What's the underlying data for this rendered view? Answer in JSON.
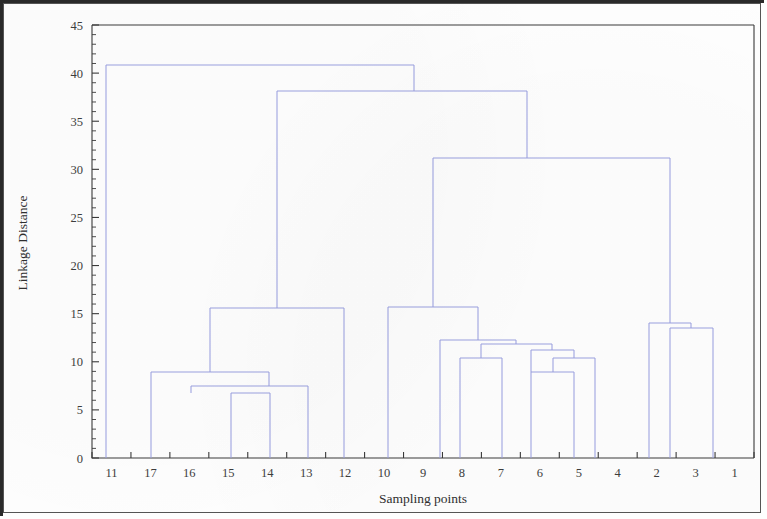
{
  "figure": {
    "border_color": "#2a2a2a",
    "background": "#fefefe"
  },
  "chart_data": {
    "type": "line",
    "chart_subtype": "dendrogram",
    "title": "",
    "xlabel": "Sampling points",
    "ylabel": "Linkage Distance",
    "grid": false,
    "legend": null,
    "link_color": "#9aa0e0",
    "ylim": [
      0,
      45
    ],
    "y_ticks": [
      0,
      5,
      10,
      15,
      20,
      25,
      30,
      35,
      40,
      45
    ],
    "y_tick_labels": [
      "0",
      "5",
      "10",
      "15",
      "20",
      "25",
      "30",
      "35",
      "40",
      "45"
    ],
    "y_minor_tick_step": 1,
    "leaf_order": [
      "11",
      "17",
      "16",
      "15",
      "14",
      "13",
      "12",
      "10",
      "9",
      "8",
      "7",
      "6",
      "5",
      "4",
      "2",
      "3",
      "1"
    ],
    "leaf_count": 17,
    "merges": [
      {
        "id": "m1",
        "label": "15 + 14",
        "children": [
          "15",
          "14"
        ],
        "height": 6.8
      },
      {
        "id": "m2",
        "label": "16 + (15,14)",
        "children": [
          "16",
          "m1"
        ],
        "height": 7.3
      },
      {
        "id": "m3",
        "label": "((16,15,14)) + 13",
        "children": [
          "m2",
          "13"
        ],
        "height": 7.6
      },
      {
        "id": "m4",
        "label": "17 + (16,15,14,13)",
        "children": [
          "17",
          "m3"
        ],
        "height": 9.2
      },
      {
        "id": "m5",
        "label": "6 + 5",
        "children": [
          "6",
          "5"
        ],
        "height": 9.2
      },
      {
        "id": "m6",
        "label": "8 + 7",
        "children": [
          "8",
          "7"
        ],
        "height": 10.3
      },
      {
        "id": "m7",
        "label": "(6,5) + 4",
        "children": [
          "m5",
          "4"
        ],
        "height": 10.4
      },
      {
        "id": "m8",
        "label": "((6,5),4) + right-mid",
        "children": [
          "m7",
          "m9"
        ],
        "height": 12.0
      },
      {
        "id": "m9",
        "label": "(8,7) merge node",
        "children": [
          "m6"
        ],
        "height": 12.2
      },
      {
        "id": "m10",
        "label": "(8,7,6,5,4) group",
        "children": [
          "m6",
          "m8"
        ],
        "height": 12.4
      },
      {
        "id": "m11",
        "label": "3 + 1",
        "children": [
          "3",
          "1"
        ],
        "height": 13.5
      },
      {
        "id": "m12",
        "label": "2 + (3,1)",
        "children": [
          "2",
          "m11"
        ],
        "height": 14.1
      },
      {
        "id": "m13",
        "label": "(17,16,15,14,13) + 12",
        "children": [
          "m4",
          "12"
        ],
        "height": 15.6
      },
      {
        "id": "m14",
        "label": "(10,9) + (8,7,6,5,4)",
        "children": [
          "m15",
          "m10"
        ],
        "height": 15.7
      },
      {
        "id": "m15",
        "label": "10 + 9",
        "children": [
          "10",
          "9"
        ],
        "height": 15.7
      },
      {
        "id": "m16",
        "label": "right-mid + (2,3,1)",
        "children": [
          "m14",
          "m12"
        ],
        "height": 31.2
      },
      {
        "id": "m17",
        "label": "left-block + right-block",
        "children": [
          "m13",
          "m16"
        ],
        "height": 37.9
      },
      {
        "id": "m18",
        "label": "root: 11 + rest",
        "children": [
          "11",
          "m17"
        ],
        "height": 40.7
      }
    ],
    "links": [
      {
        "x1": 103.0,
        "y1": 455.0,
        "x2": 103.0,
        "y2": 62.0
      },
      {
        "x1": 103.0,
        "y1": 62.0,
        "x2": 411.0,
        "y2": 62.0
      },
      {
        "x1": 411.0,
        "y1": 62.0,
        "x2": 411.0,
        "y2": 88.0
      },
      {
        "x1": 274.0,
        "y1": 88.0,
        "x2": 524.0,
        "y2": 88.0
      },
      {
        "x1": 274.0,
        "y1": 88.0,
        "x2": 274.0,
        "y2": 305.0
      },
      {
        "x1": 524.0,
        "y1": 88.0,
        "x2": 524.0,
        "y2": 155.0
      },
      {
        "x1": 430.0,
        "y1": 155.0,
        "x2": 667.0,
        "y2": 155.0
      },
      {
        "x1": 430.0,
        "y1": 155.0,
        "x2": 430.0,
        "y2": 304.0
      },
      {
        "x1": 667.0,
        "y1": 155.0,
        "x2": 667.0,
        "y2": 320.0
      },
      {
        "x1": 207.0,
        "y1": 305.0,
        "x2": 341.0,
        "y2": 305.0
      },
      {
        "x1": 207.0,
        "y1": 305.0,
        "x2": 207.0,
        "y2": 369.0
      },
      {
        "x1": 341.0,
        "y1": 305.0,
        "x2": 341.0,
        "y2": 455.0
      },
      {
        "x1": 148.0,
        "y1": 369.0,
        "x2": 266.0,
        "y2": 369.0
      },
      {
        "x1": 148.0,
        "y1": 369.0,
        "x2": 148.0,
        "y2": 455.0
      },
      {
        "x1": 266.0,
        "y1": 369.0,
        "x2": 266.0,
        "y2": 383.0
      },
      {
        "x1": 188.0,
        "y1": 383.0,
        "x2": 305.0,
        "y2": 383.0
      },
      {
        "x1": 188.0,
        "y1": 383.0,
        "x2": 188.0,
        "y2": 390.0
      },
      {
        "x1": 305.0,
        "y1": 383.0,
        "x2": 305.0,
        "y2": 455.0
      },
      {
        "x1": 228.0,
        "y1": 390.0,
        "x2": 267.0,
        "y2": 390.0
      },
      {
        "x1": 228.0,
        "y1": 390.0,
        "x2": 228.0,
        "y2": 455.0
      },
      {
        "x1": 267.0,
        "y1": 390.0,
        "x2": 267.0,
        "y2": 455.0
      },
      {
        "x1": 385.0,
        "y1": 304.0,
        "x2": 475.0,
        "y2": 304.0
      },
      {
        "x1": 385.0,
        "y1": 304.0,
        "x2": 385.0,
        "y2": 455.0
      },
      {
        "x1": 475.0,
        "y1": 304.0,
        "x2": 475.0,
        "y2": 337.0
      },
      {
        "x1": 437.0,
        "y1": 337.0,
        "x2": 513.0,
        "y2": 337.0
      },
      {
        "x1": 437.0,
        "y1": 337.0,
        "x2": 437.0,
        "y2": 455.0
      },
      {
        "x1": 513.0,
        "y1": 337.0,
        "x2": 513.0,
        "y2": 341.0
      },
      {
        "x1": 478.0,
        "y1": 341.0,
        "x2": 549.0,
        "y2": 341.0
      },
      {
        "x1": 478.0,
        "y1": 341.0,
        "x2": 478.0,
        "y2": 355.0
      },
      {
        "x1": 549.0,
        "y1": 341.0,
        "x2": 549.0,
        "y2": 347.0
      },
      {
        "x1": 457.0,
        "y1": 355.0,
        "x2": 499.0,
        "y2": 355.0
      },
      {
        "x1": 457.0,
        "y1": 355.0,
        "x2": 457.0,
        "y2": 455.0
      },
      {
        "x1": 499.0,
        "y1": 355.0,
        "x2": 499.0,
        "y2": 455.0
      },
      {
        "x1": 528.0,
        "y1": 347.0,
        "x2": 571.0,
        "y2": 347.0
      },
      {
        "x1": 528.0,
        "y1": 347.0,
        "x2": 528.0,
        "y2": 369.0
      },
      {
        "x1": 571.0,
        "y1": 347.0,
        "x2": 571.0,
        "y2": 355.0
      },
      {
        "x1": 550.0,
        "y1": 355.0,
        "x2": 592.0,
        "y2": 355.0
      },
      {
        "x1": 550.0,
        "y1": 355.0,
        "x2": 550.0,
        "y2": 369.0
      },
      {
        "x1": 592.0,
        "y1": 355.0,
        "x2": 592.0,
        "y2": 455.0
      },
      {
        "x1": 528.0,
        "y1": 369.0,
        "x2": 571.0,
        "y2": 369.0
      },
      {
        "x1": 528.0,
        "y1": 369.0,
        "x2": 528.0,
        "y2": 455.0
      },
      {
        "x1": 571.0,
        "y1": 369.0,
        "x2": 571.0,
        "y2": 455.0
      },
      {
        "x1": 646.0,
        "y1": 320.0,
        "x2": 688.0,
        "y2": 320.0
      },
      {
        "x1": 646.0,
        "y1": 320.0,
        "x2": 646.0,
        "y2": 455.0
      },
      {
        "x1": 688.0,
        "y1": 320.0,
        "x2": 688.0,
        "y2": 325.0
      },
      {
        "x1": 667.0,
        "y1": 325.0,
        "x2": 710.0,
        "y2": 325.0
      },
      {
        "x1": 667.0,
        "y1": 325.0,
        "x2": 667.0,
        "y2": 455.0
      },
      {
        "x1": 710.0,
        "y1": 325.0,
        "x2": 710.0,
        "y2": 455.0
      }
    ]
  },
  "axes": {
    "y_title": "Linkage Distance",
    "x_title": "Sampling points"
  }
}
